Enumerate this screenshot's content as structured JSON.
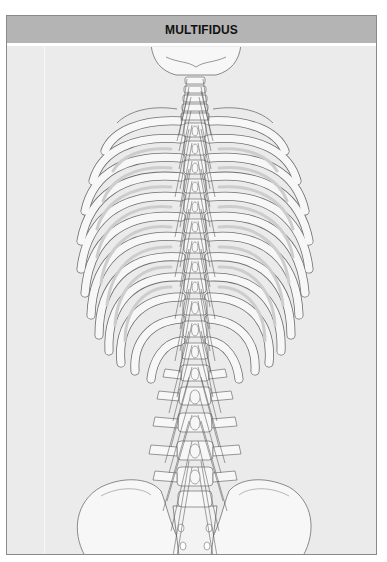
{
  "figure": {
    "title": "MULTIFIDUS",
    "structures": [
      "skull base (occiput)",
      "cervical vertebrae",
      "thoracic vertebrae",
      "ribs",
      "lumbar vertebrae",
      "sacrum",
      "ilium (pelvis)",
      "multifidus fascicles"
    ]
  },
  "colors": {
    "header_bg": "#b4b4b4",
    "panel_bg": "#ebebeb",
    "bone_fill": "#f7f7f7",
    "bone_stroke": "#6e6e6e",
    "rib_shadow": "#cdcdcd",
    "muscle_stroke": "#555555"
  }
}
